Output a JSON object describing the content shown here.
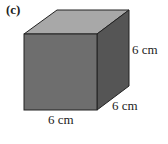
{
  "figure": {
    "part_label": "(c)",
    "shape": "cube",
    "dimensions": {
      "height": "6 cm",
      "depth": "6 cm",
      "width": "6 cm"
    },
    "colors": {
      "front_face": "#6e6e6e",
      "top_face": "#a8a8a8",
      "side_face": "#555555",
      "edge": "#222222"
    }
  }
}
